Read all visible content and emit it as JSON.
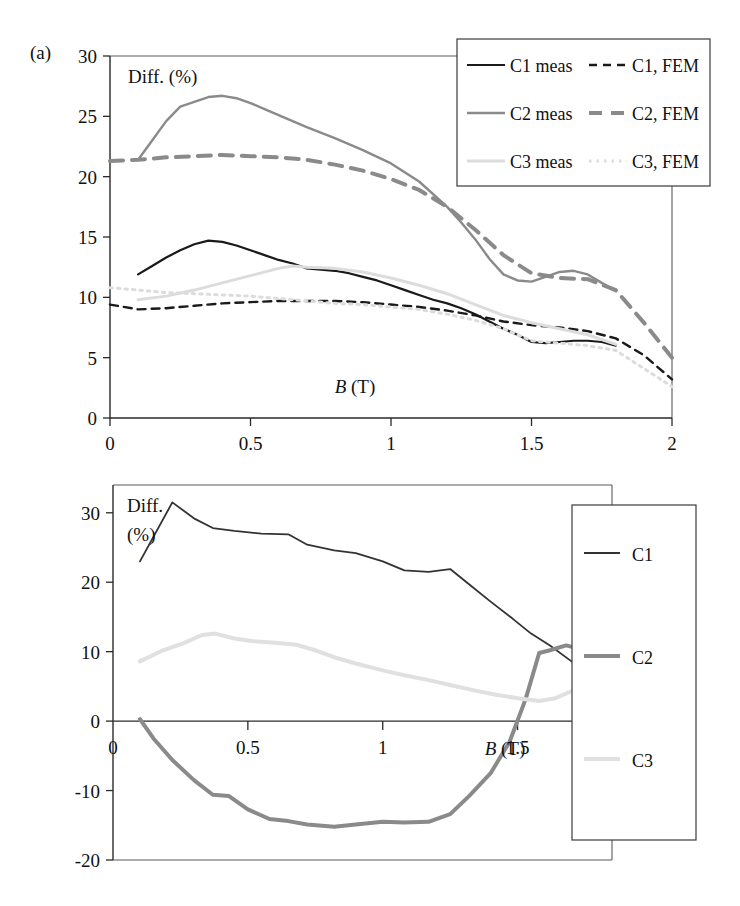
{
  "figure": {
    "panels": [
      {
        "id": "a",
        "label": "(a)"
      },
      {
        "id": "b",
        "label": "(b)"
      }
    ]
  },
  "panel_a": {
    "label": "(a)",
    "y_axis_title": "Diff. (%)",
    "x_axis_title_italic": "B",
    "x_axis_title_rest": " (T)",
    "y_ticks": [
      "0",
      "5",
      "10",
      "15",
      "20",
      "25",
      "30"
    ],
    "x_ticks": [
      "0",
      "0.5",
      "1",
      "1.5",
      "2"
    ],
    "legend": [
      {
        "label": "C1 meas",
        "style": "solid",
        "color": "#1a1a1a",
        "width": 2.2
      },
      {
        "label": "C1, FEM",
        "style": "dashed",
        "color": "#1a1a1a",
        "width": 2.4
      },
      {
        "label": "C2 meas",
        "style": "solid",
        "color": "#8a8a8a",
        "width": 2.4
      },
      {
        "label": "C2, FEM",
        "style": "dashed",
        "color": "#8a8a8a",
        "width": 4.0
      },
      {
        "label": "C3 meas",
        "style": "solid",
        "color": "#dcdcdc",
        "width": 3.0
      },
      {
        "label": "C3, FEM",
        "style": "dotted",
        "color": "#dcdcdc",
        "width": 3.0
      }
    ]
  },
  "panel_b": {
    "label": "(b)",
    "y_axis_title_line1": "Diff.",
    "y_axis_title_line2": "(%)",
    "x_axis_title_italic": "B",
    "x_axis_title_rest": " (T)",
    "y_ticks": [
      "-20",
      "-10",
      "0",
      "10",
      "20",
      "30"
    ],
    "x_ticks": [
      "0",
      "0.5",
      "1",
      "1.5"
    ],
    "x_origin_label": "0",
    "legend": [
      {
        "label": "C1",
        "style": "solid",
        "color": "#333333",
        "width": 1.8
      },
      {
        "label": "C2",
        "style": "solid",
        "color": "#8a8a8a",
        "width": 4.0
      },
      {
        "label": "C3",
        "style": "solid",
        "color": "#e0e0e0",
        "width": 4.0
      }
    ]
  },
  "chart_data": [
    {
      "type": "line",
      "panel": "a",
      "title": "",
      "xlabel": "B (T)",
      "ylabel": "Diff. (%)",
      "xlim": [
        0,
        2
      ],
      "ylim": [
        0,
        30
      ],
      "xticks": [
        0,
        0.5,
        1,
        1.5,
        2
      ],
      "yticks": [
        0,
        5,
        10,
        15,
        20,
        25,
        30
      ],
      "grid": false,
      "legend_position": "top-right",
      "series": [
        {
          "name": "C1 meas",
          "style": "solid",
          "color": "#1a1a1a",
          "x": [
            0.1,
            0.15,
            0.2,
            0.25,
            0.3,
            0.35,
            0.4,
            0.45,
            0.5,
            0.55,
            0.6,
            0.65,
            0.7,
            0.75,
            0.8,
            0.85,
            0.9,
            0.95,
            1.0,
            1.05,
            1.1,
            1.15,
            1.2,
            1.25,
            1.3,
            1.35,
            1.4,
            1.45,
            1.5,
            1.55,
            1.6,
            1.65,
            1.7,
            1.75,
            1.8
          ],
          "y": [
            11.9,
            12.6,
            13.3,
            13.9,
            14.4,
            14.7,
            14.6,
            14.3,
            13.9,
            13.5,
            13.1,
            12.8,
            12.4,
            12.3,
            12.2,
            12.0,
            11.7,
            11.4,
            11.0,
            10.6,
            10.2,
            9.8,
            9.5,
            9.1,
            8.6,
            8.0,
            7.4,
            6.9,
            6.3,
            6.2,
            6.3,
            6.4,
            6.4,
            6.3,
            6.0
          ]
        },
        {
          "name": "C1, FEM",
          "style": "dashed",
          "color": "#1a1a1a",
          "x": [
            0.0,
            0.1,
            0.2,
            0.3,
            0.4,
            0.5,
            0.6,
            0.7,
            0.8,
            0.9,
            1.0,
            1.1,
            1.2,
            1.3,
            1.4,
            1.5,
            1.6,
            1.7,
            1.8,
            1.9,
            2.0
          ],
          "y": [
            9.4,
            9.0,
            9.1,
            9.3,
            9.5,
            9.6,
            9.7,
            9.7,
            9.7,
            9.6,
            9.4,
            9.2,
            8.9,
            8.5,
            8.0,
            7.7,
            7.5,
            7.2,
            6.6,
            5.2,
            3.2
          ]
        },
        {
          "name": "C2 meas",
          "style": "solid",
          "color": "#8a8a8a",
          "x": [
            0.1,
            0.15,
            0.2,
            0.25,
            0.3,
            0.35,
            0.4,
            0.45,
            0.5,
            0.55,
            0.6,
            0.65,
            0.7,
            0.8,
            0.9,
            1.0,
            1.1,
            1.2,
            1.25,
            1.3,
            1.35,
            1.4,
            1.45,
            1.5,
            1.55,
            1.6,
            1.65,
            1.7,
            1.75,
            1.8
          ],
          "y": [
            21.4,
            23.0,
            24.6,
            25.8,
            26.2,
            26.6,
            26.7,
            26.5,
            26.1,
            25.6,
            25.1,
            24.6,
            24.1,
            23.2,
            22.2,
            21.1,
            19.6,
            17.5,
            16.2,
            14.8,
            13.2,
            11.9,
            11.4,
            11.3,
            11.7,
            12.1,
            12.2,
            11.9,
            11.2,
            10.5
          ]
        },
        {
          "name": "C2, FEM",
          "style": "dashed",
          "color": "#8a8a8a",
          "x": [
            0.0,
            0.1,
            0.2,
            0.3,
            0.4,
            0.5,
            0.6,
            0.7,
            0.8,
            0.9,
            1.0,
            1.1,
            1.2,
            1.3,
            1.4,
            1.5,
            1.6,
            1.7,
            1.8,
            1.9,
            2.0
          ],
          "y": [
            21.3,
            21.4,
            21.6,
            21.7,
            21.8,
            21.7,
            21.6,
            21.4,
            21.0,
            20.5,
            19.8,
            18.9,
            17.5,
            15.6,
            13.5,
            12.0,
            11.6,
            11.5,
            10.6,
            7.9,
            5.0
          ]
        },
        {
          "name": "C3 meas",
          "style": "solid",
          "color": "#dcdcdc",
          "x": [
            0.1,
            0.2,
            0.3,
            0.4,
            0.5,
            0.6,
            0.65,
            0.7,
            0.8,
            0.9,
            1.0,
            1.1,
            1.2,
            1.3,
            1.4,
            1.5,
            1.6,
            1.7,
            1.8
          ],
          "y": [
            9.8,
            10.1,
            10.6,
            11.2,
            11.8,
            12.4,
            12.6,
            12.5,
            12.4,
            12.1,
            11.6,
            11.0,
            10.3,
            9.4,
            8.5,
            7.9,
            7.4,
            6.9,
            6.1
          ]
        },
        {
          "name": "C3, FEM",
          "style": "dotted",
          "color": "#dcdcdc",
          "x": [
            0.0,
            0.1,
            0.2,
            0.3,
            0.4,
            0.5,
            0.6,
            0.7,
            0.8,
            0.9,
            1.0,
            1.1,
            1.2,
            1.3,
            1.4,
            1.5,
            1.6,
            1.7,
            1.8,
            1.9,
            2.0
          ],
          "y": [
            10.8,
            10.6,
            10.4,
            10.3,
            10.2,
            10.1,
            9.9,
            9.7,
            9.5,
            9.4,
            9.2,
            9.0,
            8.6,
            8.1,
            7.4,
            6.4,
            6.2,
            6.0,
            5.6,
            4.1,
            2.6
          ]
        }
      ]
    },
    {
      "type": "line",
      "panel": "b",
      "title": "",
      "xlabel": "B (T)",
      "ylabel": "Diff. (%)",
      "xlim": [
        0,
        1.85
      ],
      "ylim": [
        -20,
        34
      ],
      "xticks": [
        0,
        0.5,
        1,
        1.5
      ],
      "yticks": [
        -20,
        -10,
        0,
        10,
        20,
        30
      ],
      "grid": false,
      "legend_position": "right",
      "series": [
        {
          "name": "C1",
          "style": "solid",
          "color": "#333333",
          "x": [
            0.1,
            0.22,
            0.3,
            0.37,
            0.45,
            0.55,
            0.65,
            0.72,
            0.82,
            0.9,
            1.0,
            1.08,
            1.17,
            1.25,
            1.32,
            1.4,
            1.48,
            1.55,
            1.62,
            1.7,
            1.76
          ],
          "y": [
            23.0,
            31.5,
            29.2,
            27.8,
            27.4,
            27.0,
            26.9,
            25.4,
            24.6,
            24.2,
            23.0,
            21.7,
            21.5,
            21.9,
            19.7,
            17.2,
            14.8,
            12.6,
            10.9,
            8.6,
            6.7
          ]
        },
        {
          "name": "C2",
          "style": "solid",
          "color": "#8a8a8a",
          "x": [
            0.1,
            0.15,
            0.22,
            0.3,
            0.37,
            0.43,
            0.5,
            0.58,
            0.65,
            0.72,
            0.82,
            0.9,
            1.0,
            1.08,
            1.17,
            1.25,
            1.32,
            1.4,
            1.47,
            1.53,
            1.58,
            1.62,
            1.68,
            1.74,
            1.8
          ],
          "y": [
            0.3,
            -2.5,
            -5.6,
            -8.5,
            -10.6,
            -10.8,
            -12.7,
            -14.1,
            -14.4,
            -14.9,
            -15.2,
            -14.9,
            -14.5,
            -14.6,
            -14.5,
            -13.4,
            -10.8,
            -7.5,
            -3.0,
            3.2,
            9.8,
            10.2,
            10.9,
            10.3,
            9.0
          ]
        },
        {
          "name": "C3",
          "style": "solid",
          "color": "#e0e0e0",
          "x": [
            0.1,
            0.18,
            0.26,
            0.33,
            0.38,
            0.45,
            0.52,
            0.6,
            0.68,
            0.75,
            0.82,
            0.9,
            1.0,
            1.08,
            1.17,
            1.25,
            1.33,
            1.42,
            1.5,
            1.58,
            1.64,
            1.7,
            1.76,
            1.82
          ],
          "y": [
            8.6,
            10.1,
            11.2,
            12.4,
            12.6,
            11.9,
            11.5,
            11.3,
            11.0,
            10.2,
            9.2,
            8.3,
            7.3,
            6.6,
            5.9,
            5.2,
            4.5,
            3.8,
            3.3,
            2.9,
            3.3,
            4.3,
            5.3,
            5.2
          ]
        }
      ]
    }
  ]
}
